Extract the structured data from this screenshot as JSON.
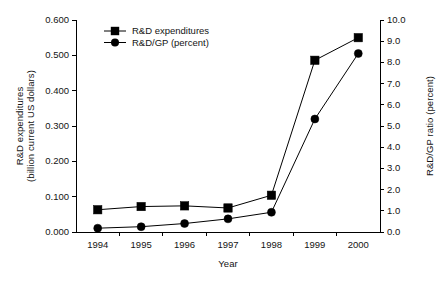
{
  "chart_data": {
    "type": "line",
    "title": "",
    "xlabel": "Year",
    "ylabel": "R&D expenditures (billion current US dollars)",
    "ylabel_line1": "R&D expenditures",
    "ylabel_line2": "(billion current US dollars)",
    "y2label": "R&D/GP ratio (percent)",
    "categories": [
      "1994",
      "1995",
      "1996",
      "1997",
      "1998",
      "1999",
      "2000"
    ],
    "x": [
      1994,
      1995,
      1996,
      1997,
      1998,
      1999,
      2000
    ],
    "ylim": [
      0.0,
      0.6
    ],
    "y2lim": [
      0.0,
      10.0
    ],
    "yticks": [
      "0.000",
      "0.100",
      "0.200",
      "0.300",
      "0.400",
      "0.500",
      "0.600"
    ],
    "ytick_values": [
      0.0,
      0.1,
      0.2,
      0.3,
      0.4,
      0.5,
      0.6
    ],
    "y2ticks": [
      "0.0",
      "1.0",
      "2.0",
      "3.0",
      "4.0",
      "5.0",
      "6.0",
      "7.0",
      "8.0",
      "9.0",
      "10.0"
    ],
    "y2tick_values": [
      0.0,
      1.0,
      2.0,
      3.0,
      4.0,
      5.0,
      6.0,
      7.0,
      8.0,
      9.0,
      10.0
    ],
    "grid": false,
    "legend_position": "top-left-inside",
    "series": [
      {
        "name": "R&D expenditures",
        "marker": "square",
        "axis": "left",
        "color": "#000000",
        "values": [
          0.063,
          0.072,
          0.074,
          0.068,
          0.104,
          0.486,
          0.55
        ]
      },
      {
        "name": "R&D/GP (percent)",
        "marker": "circle",
        "axis": "right",
        "color": "#000000",
        "values": [
          0.18,
          0.25,
          0.4,
          0.62,
          0.93,
          5.33,
          8.42
        ]
      }
    ]
  },
  "style": {
    "axis_color": "#000000",
    "plot_background": "#ffffff",
    "line_color": "#000000"
  }
}
